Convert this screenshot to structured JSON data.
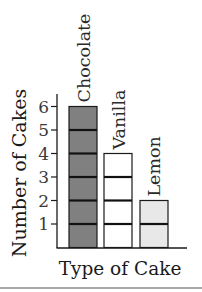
{
  "chart_data": {
    "type": "bar",
    "title": "",
    "xlabel": "Type of Cake",
    "ylabel": "Number of Cakes",
    "categories": [
      "Chocolate",
      "Vanilla",
      "Lemon"
    ],
    "values": [
      6,
      4,
      2
    ],
    "ylim": [
      0,
      6
    ],
    "yticks": [
      1,
      2,
      3,
      4,
      5,
      6
    ],
    "bar_colors": [
      "#808080",
      "#ffffff",
      "#e8e8e8"
    ],
    "unit_segments": true,
    "category_labels_position": "rotated above bars",
    "grid": false,
    "legend": null
  },
  "colors": {
    "axis": "#1a1a1a",
    "segment_line": "#111111",
    "bottom_rule": "#a8a8a8"
  }
}
